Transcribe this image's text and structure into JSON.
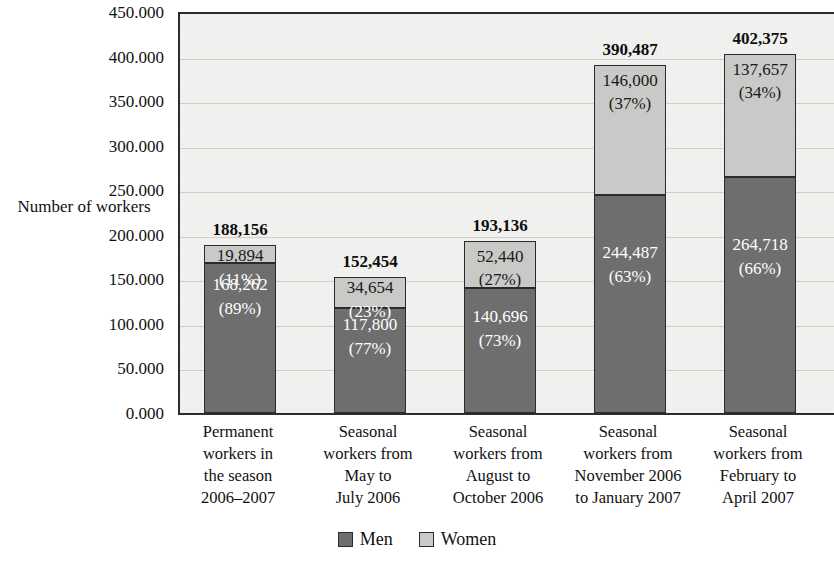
{
  "chart_data": {
    "type": "bar",
    "subtype": "stacked-bar",
    "title": "",
    "xlabel": "",
    "ylabel": "Number of workers",
    "ylim": [
      0,
      450
    ],
    "ytick_labels": [
      "450.000",
      "400.000",
      "350.000",
      "300.000",
      "250.000",
      "200.000",
      "150.000",
      "100.000",
      "50.000",
      "0.000"
    ],
    "ytick_values": [
      450000,
      400000,
      350000,
      300000,
      250000,
      200000,
      150000,
      100000,
      50000,
      0
    ],
    "grid": true,
    "legend_position": "bottom",
    "categories": [
      "Permanent workers in the season 2006–2007",
      "Seasonal workers from May to July 2006",
      "Seasonal workers from August to October 2006",
      "Seasonal workers from November 2006 to January 2007",
      "Seasonal workers from February to April 2007"
    ],
    "category_lines": [
      [
        "Permanent",
        "workers in",
        "the season",
        "2006–2007"
      ],
      [
        "Seasonal",
        "workers from",
        "May to",
        "July 2006"
      ],
      [
        "Seasonal",
        "workers from",
        "August to",
        "October 2006"
      ],
      [
        "Seasonal",
        "workers from",
        "November 2006",
        "to January 2007"
      ],
      [
        "Seasonal",
        "workers from",
        "February to",
        "April 2007"
      ]
    ],
    "series": [
      {
        "name": "Men",
        "color": "#6e6e6e",
        "values": [
          168262,
          117800,
          140696,
          244487,
          264718
        ],
        "value_labels": [
          "168,262",
          "117,800",
          "140,696",
          "244,487",
          "264,718"
        ],
        "percent_labels": [
          "(89%)",
          "(77%)",
          "(73%)",
          "(63%)",
          "(66%)"
        ]
      },
      {
        "name": "Women",
        "color": "#c9c9c7",
        "values": [
          19894,
          34654,
          52440,
          146000,
          137657
        ],
        "value_labels": [
          "19,894",
          "34,654",
          "52,440",
          "146,000",
          "137,657"
        ],
        "percent_labels": [
          "(11%)",
          "(23%)",
          "(27%)",
          "(37%)",
          "(34%)"
        ]
      }
    ],
    "totals": [
      188156,
      152454,
      193136,
      390487,
      402375
    ],
    "total_labels": [
      "188,156",
      "152,454",
      "193,136",
      "390,487",
      "402,375"
    ]
  },
  "legend": {
    "items": [
      {
        "label": "Men",
        "color": "#6e6e6e"
      },
      {
        "label": "Women",
        "color": "#c9c9c7"
      }
    ]
  },
  "axis": {
    "y_title_line1": "Number of",
    "y_title_line2": "workers"
  }
}
